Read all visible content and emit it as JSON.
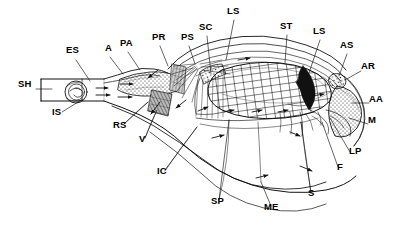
{
  "figure": {
    "type": "anatomical-diagram",
    "background_color": "#ffffff",
    "ink_color": "#000000",
    "width": 402,
    "height": 228
  },
  "labels": [
    {
      "id": "SH",
      "text": "SH",
      "x": 18,
      "y": 84,
      "leader": [
        [
          36,
          89
        ],
        [
          52,
          89
        ]
      ]
    },
    {
      "id": "ES",
      "text": "ES",
      "x": 66,
      "y": 50,
      "leader": [
        [
          76,
          60
        ],
        [
          90,
          81
        ]
      ]
    },
    {
      "id": "IS",
      "text": "IS",
      "x": 52,
      "y": 112,
      "leader": [
        [
          62,
          112
        ],
        [
          83,
          99
        ]
      ]
    },
    {
      "id": "A",
      "text": "A",
      "x": 106,
      "y": 48,
      "leader": [
        [
          110,
          57
        ],
        [
          123,
          74
        ]
      ]
    },
    {
      "id": "PA",
      "text": "PA",
      "x": 121,
      "y": 43,
      "leader": [
        [
          128,
          52
        ],
        [
          140,
          70
        ]
      ]
    },
    {
      "id": "PR",
      "text": "PR",
      "x": 153,
      "y": 37,
      "leader": [
        [
          160,
          46
        ],
        [
          168,
          66
        ]
      ]
    },
    {
      "id": "PS",
      "text": "PS",
      "x": 182,
      "y": 37,
      "leader": [
        [
          189,
          46
        ],
        [
          195,
          64
        ]
      ]
    },
    {
      "id": "SC",
      "text": "SC",
      "x": 200,
      "y": 27,
      "leader": [
        [
          207,
          36
        ],
        [
          211,
          74
        ]
      ]
    },
    {
      "id": "LS1",
      "text": "LS",
      "x": 228,
      "y": 11,
      "leader": [
        [
          234,
          20
        ],
        [
          226,
          60
        ]
      ]
    },
    {
      "id": "ST",
      "text": "ST",
      "x": 281,
      "y": 26,
      "leader": [
        [
          287,
          35
        ],
        [
          285,
          63
        ]
      ]
    },
    {
      "id": "LS2",
      "text": "LS",
      "x": 314,
      "y": 31,
      "leader": [
        [
          320,
          40
        ],
        [
          309,
          73
        ]
      ]
    },
    {
      "id": "AS",
      "text": "AS",
      "x": 341,
      "y": 45,
      "leader": [
        [
          347,
          54
        ],
        [
          339,
          76
        ]
      ]
    },
    {
      "id": "AR",
      "text": "AR",
      "x": 362,
      "y": 66,
      "leader": [
        [
          361,
          71
        ],
        [
          345,
          80
        ]
      ]
    },
    {
      "id": "AA",
      "text": "AA",
      "x": 370,
      "y": 99,
      "leader": [
        [
          369,
          103
        ],
        [
          352,
          103
        ]
      ]
    },
    {
      "id": "M",
      "text": "M",
      "x": 369,
      "y": 120,
      "leader": [
        [
          368,
          124
        ],
        [
          349,
          118
        ]
      ]
    },
    {
      "id": "LP",
      "text": "LP",
      "x": 350,
      "y": 150,
      "leader": [
        [
          350,
          152
        ],
        [
          330,
          118
        ]
      ]
    },
    {
      "id": "F",
      "text": "F",
      "x": 338,
      "y": 166,
      "leader": [
        [
          338,
          167
        ],
        [
          322,
          122
        ]
      ]
    },
    {
      "id": "S",
      "text": "S",
      "x": 309,
      "y": 193,
      "leader": [
        [
          311,
          193
        ],
        [
          301,
          122
        ]
      ]
    },
    {
      "id": "ME",
      "text": "ME",
      "x": 265,
      "y": 207,
      "leader": [
        [
          271,
          206
        ],
        [
          261,
          182
        ]
      ]
    },
    {
      "id": "SP",
      "text": "SP",
      "x": 212,
      "y": 201,
      "leader": [
        [
          219,
          200
        ],
        [
          229,
          120
        ]
      ]
    },
    {
      "id": "IC",
      "text": "IC",
      "x": 158,
      "y": 171,
      "leader": [
        [
          165,
          170
        ],
        [
          197,
          127
        ]
      ]
    },
    {
      "id": "V",
      "text": "V",
      "x": 140,
      "y": 139,
      "leader": [
        [
          145,
          138
        ],
        [
          157,
          110
        ]
      ]
    },
    {
      "id": "RS",
      "text": "RS",
      "x": 114,
      "y": 125,
      "leader": [
        [
          124,
          124
        ],
        [
          148,
          102
        ]
      ]
    }
  ],
  "structures": {
    "shell": "SH",
    "esophagus": "ES",
    "intestine_section": "IS",
    "anus": "A",
    "posterior_adductor": "PA",
    "pericardium": "PR",
    "posterior_siphon": "PS",
    "stomach_caecum": "SC",
    "left_shell_valve": "LS",
    "stomach": "ST",
    "anterior_siphon": "AS",
    "anterior_retractor": "AR",
    "anterior_adductor": "AA",
    "mouth": "M",
    "labial_palp": "LP",
    "foot": "F",
    "style_sac": "S",
    "mantle_edge": "ME",
    "suprabranchial_passage": "SP",
    "inhalant_current": "IC",
    "ventricle": "V",
    "rectum_sac": "RS"
  }
}
